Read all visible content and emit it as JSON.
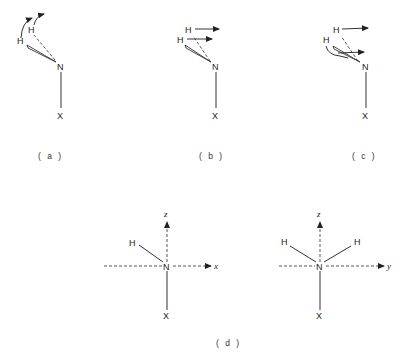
{
  "panels": {
    "a": {
      "caption": "( a )",
      "atoms": {
        "h1": "H",
        "h2": "H",
        "n": "N",
        "x": "X"
      },
      "motion": "curved-arrows-rotation"
    },
    "b": {
      "caption": "( b )",
      "atoms": {
        "h1": "H",
        "h2": "H",
        "n": "N",
        "x": "X"
      },
      "motion": "parallel-arrows-translation"
    },
    "c": {
      "caption": "( c )",
      "atoms": {
        "h1": "H",
        "h2": "H",
        "n": "N",
        "x": "X"
      },
      "motion": "arrows-and-curved-arrow"
    },
    "d": {
      "caption": "( d )",
      "left": {
        "atoms": {
          "h": "H",
          "n": "N",
          "x": "X"
        },
        "axes": {
          "vertical": "z",
          "horizontal": "x"
        }
      },
      "right": {
        "atoms": {
          "h1": "H",
          "h2": "H",
          "n": "N",
          "x": "X"
        },
        "axes": {
          "vertical": "z",
          "horizontal": "y"
        }
      }
    }
  },
  "colors": {
    "ink": "#333333",
    "background": "#ffffff"
  }
}
